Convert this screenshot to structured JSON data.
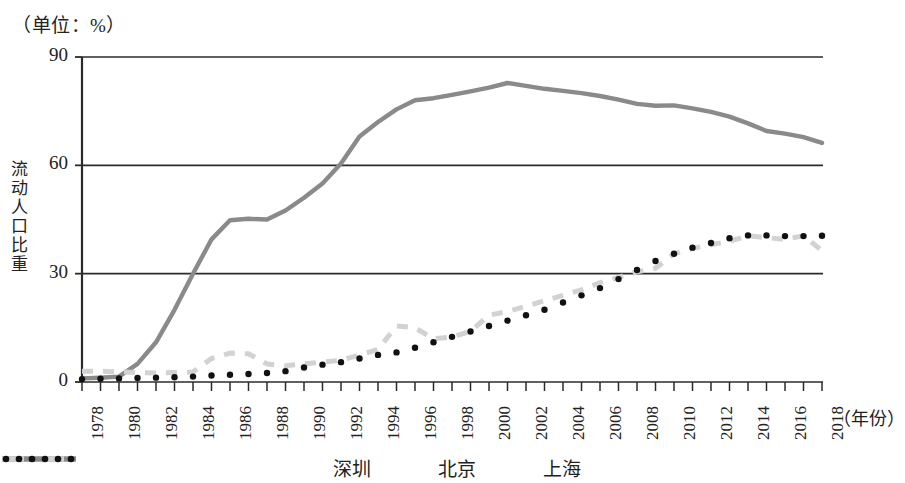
{
  "chart_data": {
    "type": "line",
    "title": "（单位：%）",
    "xlabel": "（年份）",
    "ylabel": "流动人口比重",
    "ylim": [
      0,
      90
    ],
    "yticks": [
      "0",
      "30",
      "60",
      "90"
    ],
    "xlim": [
      1978,
      2018
    ],
    "grid": "horizontal",
    "legend_position": "bottom-center",
    "categories": [
      1978,
      1979,
      1980,
      1981,
      1982,
      1983,
      1984,
      1985,
      1986,
      1987,
      1988,
      1989,
      1990,
      1991,
      1992,
      1993,
      1994,
      1995,
      1996,
      1997,
      1998,
      1999,
      2000,
      2001,
      2002,
      2003,
      2004,
      2005,
      2006,
      2007,
      2008,
      2009,
      2010,
      2011,
      2012,
      2013,
      2014,
      2015,
      2016,
      2017,
      2018
    ],
    "xticks": [
      "1978",
      "1980",
      "1982",
      "1984",
      "1986",
      "1988",
      "1990",
      "1992",
      "1994",
      "1996",
      "1998",
      "2000",
      "2002",
      "2004",
      "2006",
      "2008",
      "2010",
      "2012",
      "2014",
      "2016",
      "2018"
    ],
    "series": [
      {
        "name": "深圳",
        "style": "solid",
        "color": "#8a8a8a",
        "values": [
          1.0,
          1.2,
          1.5,
          5.0,
          11.0,
          20.0,
          30.0,
          39.5,
          44.8,
          45.2,
          45.0,
          47.5,
          51.0,
          55.0,
          60.5,
          68.0,
          72.0,
          75.5,
          78.0,
          78.6,
          79.5,
          80.5,
          81.5,
          82.8,
          82.0,
          81.2,
          80.6,
          80.0,
          79.2,
          78.2,
          77.0,
          76.5,
          76.6,
          75.8,
          74.8,
          73.5,
          71.6,
          69.5,
          68.8,
          67.8,
          66.2
        ]
      },
      {
        "name": "北京",
        "style": "dashed",
        "color": "#d2d2d2",
        "values": [
          3.0,
          3.0,
          2.8,
          2.6,
          2.5,
          2.6,
          2.8,
          6.5,
          8.0,
          7.8,
          5.0,
          4.5,
          5.0,
          5.5,
          6.0,
          7.5,
          9.0,
          15.5,
          15.0,
          12.0,
          12.5,
          14.0,
          18.5,
          19.5,
          21.0,
          22.5,
          24.0,
          25.5,
          27.5,
          29.0,
          30.5,
          31.5,
          35.5,
          37.0,
          38.0,
          39.0,
          40.5,
          40.0,
          39.5,
          40.5,
          36.4
        ]
      },
      {
        "name": "上海",
        "style": "dotted",
        "color": "#111111",
        "values": [
          0.8,
          0.9,
          1.0,
          1.1,
          1.2,
          1.3,
          1.5,
          1.8,
          2.0,
          2.2,
          2.5,
          3.0,
          4.0,
          4.8,
          5.5,
          6.5,
          7.5,
          8.2,
          9.5,
          11.0,
          12.5,
          14.0,
          15.5,
          17.0,
          18.5,
          20.0,
          22.0,
          24.0,
          26.0,
          28.5,
          31.0,
          33.5,
          35.5,
          37.2,
          38.5,
          39.8,
          40.6,
          40.6,
          40.4,
          40.4,
          40.5
        ]
      }
    ]
  },
  "legend": {
    "items": [
      {
        "label": "深圳",
        "style": "solid",
        "color": "#8a8a8a"
      },
      {
        "label": "北京",
        "style": "dashed",
        "color": "#d2d2d2"
      },
      {
        "label": "上海",
        "style": "dotted",
        "color": "#111111"
      }
    ]
  }
}
